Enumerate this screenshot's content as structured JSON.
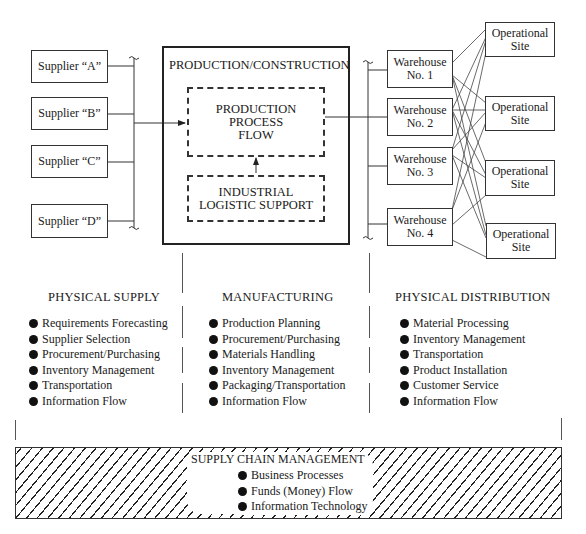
{
  "suppliers": [
    {
      "label": "Supplier “A”"
    },
    {
      "label": "Supplier “B”"
    },
    {
      "label": "Supplier “C”"
    },
    {
      "label": "Supplier “D”"
    }
  ],
  "production": {
    "title": "PRODUCTION/CONSTRUCTION",
    "process_flow": [
      "PRODUCTION",
      "PROCESS",
      "FLOW"
    ],
    "logistic_support": [
      "INDUSTRIAL",
      "LOGISTIC SUPPORT"
    ]
  },
  "warehouses": [
    {
      "line1": "Warehouse",
      "line2": "No. 1"
    },
    {
      "line1": "Warehouse",
      "line2": "No. 2"
    },
    {
      "line1": "Warehouse",
      "line2": "No. 3"
    },
    {
      "line1": "Warehouse",
      "line2": "No. 4"
    }
  ],
  "sites": [
    {
      "line1": "Operational",
      "line2": "Site"
    },
    {
      "line1": "Operational",
      "line2": "Site"
    },
    {
      "line1": "Operational",
      "line2": "Site"
    },
    {
      "line1": "Operational",
      "line2": "Site"
    }
  ],
  "columns": {
    "physical_supply": {
      "title": "PHYSICAL SUPPLY",
      "items": [
        "Requirements Forecasting",
        "Supplier Selection",
        "Procurement/Purchasing",
        "Inventory Management",
        "Transportation",
        "Information Flow"
      ]
    },
    "manufacturing": {
      "title": "MANUFACTURING",
      "items": [
        "Production Planning",
        "Procurement/Purchasing",
        "Materials Handling",
        "Inventory Management",
        "Packaging/Transportation",
        "Information Flow"
      ]
    },
    "physical_distribution": {
      "title": "PHYSICAL DISTRIBUTION",
      "items": [
        "Material Processing",
        "Inventory Management",
        "Transportation",
        "Product Installation",
        "Customer Service",
        "Information Flow"
      ]
    }
  },
  "supply_chain_management": {
    "title": "SUPPLY CHAIN MANAGEMENT",
    "items": [
      "Business Processes",
      "Funds (Money) Flow",
      "Information Technology"
    ]
  },
  "icons": {
    "bullet": "filled-circle",
    "bracket": "brace-tilde"
  }
}
